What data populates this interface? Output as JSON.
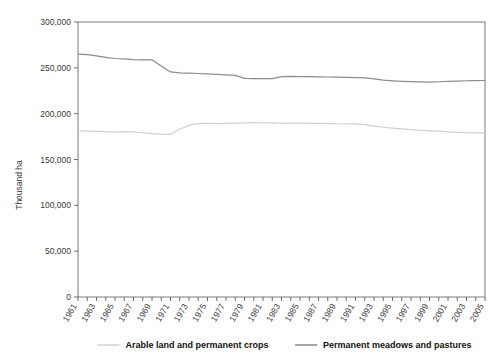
{
  "chart_data": {
    "type": "line",
    "title": "",
    "xlabel": "",
    "ylabel": "Thousand ha",
    "ylim": [
      0,
      300000
    ],
    "xlim": [
      1961,
      2005
    ],
    "grid": false,
    "legend_position": "bottom",
    "ytick_labels": [
      "300,000",
      "250,000",
      "200,000",
      "150,000",
      "100,000",
      "50,000",
      "0"
    ],
    "ytick_values": [
      300000,
      250000,
      200000,
      150000,
      100000,
      50000,
      0
    ],
    "xtick_labels": [
      "1961",
      "1963",
      "1965",
      "1967",
      "1969",
      "1971",
      "1973",
      "1975",
      "1977",
      "1979",
      "1981",
      "1983",
      "1985",
      "1987",
      "1989",
      "1991",
      "1993",
      "1995",
      "1997",
      "1999",
      "2001",
      "2003",
      "2005"
    ],
    "x": [
      1961,
      1962,
      1963,
      1964,
      1965,
      1966,
      1967,
      1968,
      1969,
      1970,
      1971,
      1972,
      1973,
      1974,
      1975,
      1976,
      1977,
      1978,
      1979,
      1980,
      1981,
      1982,
      1983,
      1984,
      1985,
      1986,
      1987,
      1988,
      1989,
      1990,
      1991,
      1992,
      1993,
      1994,
      1995,
      1996,
      1997,
      1998,
      1999,
      2000,
      2001,
      2002,
      2003,
      2004,
      2005
    ],
    "series": [
      {
        "name": "Arable land and permanent crops",
        "color": "#d0d0d0",
        "values": [
          181500,
          181000,
          180600,
          180300,
          179800,
          180400,
          180200,
          179200,
          178300,
          177700,
          177400,
          183000,
          187200,
          189200,
          189300,
          189200,
          189300,
          189600,
          189800,
          190200,
          190100,
          189900,
          189300,
          189700,
          189800,
          189400,
          189300,
          189200,
          189000,
          189000,
          188800,
          188000,
          186500,
          185200,
          184200,
          183300,
          182600,
          181900,
          181300,
          180900,
          180100,
          179600,
          179200,
          179000,
          178800
        ]
      },
      {
        "name": "Permanent meadows and pastures",
        "color": "#8c8c8c",
        "values": [
          265000,
          264500,
          263000,
          261500,
          260200,
          259800,
          259000,
          258600,
          258800,
          252000,
          245500,
          244500,
          244200,
          243800,
          243300,
          242800,
          242300,
          241800,
          238500,
          238300,
          238200,
          238300,
          240500,
          240700,
          240400,
          240300,
          240200,
          240000,
          239800,
          239600,
          239400,
          239000,
          238000,
          236500,
          235800,
          235300,
          234900,
          234600,
          234500,
          234800,
          235200,
          235600,
          235900,
          236100,
          236200
        ]
      }
    ]
  },
  "legend": {
    "items": [
      {
        "label": "Arable land and permanent crops",
        "color": "#cfcfcf"
      },
      {
        "label": "Permanent meadows and pastures",
        "color": "#7d7d7d"
      }
    ]
  }
}
